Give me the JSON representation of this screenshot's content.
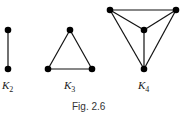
{
  "caption": "Fig. 2.6",
  "graphs": [
    {
      "name": "K",
      "sub": "2",
      "vertices": [
        [
          8,
          30
        ],
        [
          8,
          69
        ]
      ],
      "edges": [
        [
          0,
          1
        ]
      ]
    },
    {
      "name": "K",
      "sub": "3",
      "vertices": [
        [
          70,
          30
        ],
        [
          48,
          69
        ],
        [
          92,
          69
        ]
      ],
      "edges": [
        [
          0,
          1
        ],
        [
          1,
          2
        ],
        [
          0,
          2
        ]
      ]
    },
    {
      "name": "K",
      "sub": "4",
      "vertices": [
        [
          110,
          10
        ],
        [
          176,
          10
        ],
        [
          144,
          30
        ],
        [
          144,
          69
        ]
      ],
      "edges": [
        [
          0,
          1
        ],
        [
          0,
          2
        ],
        [
          1,
          2
        ],
        [
          0,
          3
        ],
        [
          1,
          3
        ],
        [
          2,
          3
        ]
      ]
    }
  ],
  "colors": {
    "stroke": "#111111",
    "vertex": "#000000"
  }
}
